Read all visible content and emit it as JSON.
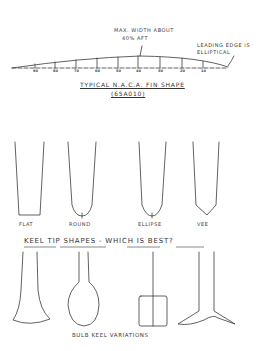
{
  "fin_profile": {
    "annotation_max_width": [
      "MAX. WIDTH ABOUT",
      "40% AFT"
    ],
    "annotation_leading_edge": [
      "LEADING EDGE IS",
      "ELLIPTICAL"
    ],
    "title": "TYPICAL N.A.C.A. FIN SHAPE",
    "subtitle": "(65A010)",
    "station_labels": [
      "90",
      "80",
      "70",
      "60",
      "50",
      "40",
      "30",
      "20",
      "10"
    ]
  },
  "keel_tips": {
    "shapes": [
      {
        "name": "flat",
        "label": "FLAT"
      },
      {
        "name": "round",
        "label": "ROUND"
      },
      {
        "name": "ellipse",
        "label": "ELLIPSE"
      },
      {
        "name": "vee",
        "label": "VEE"
      }
    ],
    "caption": "KEEL TIP SHAPES  -  WHICH IS BEST?"
  },
  "bulb_keels": {
    "caption": "BULB KEEL VARIATIONS"
  },
  "colors": {
    "ink": "#3a3a3a",
    "paper": "#ffffff"
  }
}
